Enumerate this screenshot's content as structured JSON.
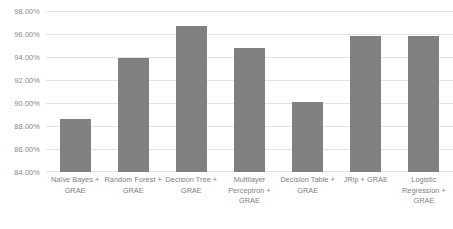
{
  "chart_data": {
    "type": "bar",
    "title": "",
    "xlabel": "",
    "ylabel": "",
    "grid": true,
    "legend": false,
    "ylim": [
      84.0,
      98.0
    ],
    "ytick_values": [
      98.0,
      96.0,
      94.0,
      92.0,
      90.0,
      88.0,
      86.0,
      84.0
    ],
    "ytick_labels": [
      "98.00%",
      "96.00%",
      "94.00%",
      "92.00%",
      "90.00%",
      "88.00%",
      "86.00%",
      "84.00%"
    ],
    "categories": [
      "Naïve Bayes + GRAE",
      "Random Forest + GRAE",
      "Decision Tree + GRAE",
      "Multilayer Perceptron + GRAE",
      "Decision Table + GRAE",
      "JRip + GRAE",
      "Logistic Regression + GRAE"
    ],
    "values": [
      88.6,
      93.9,
      96.7,
      94.8,
      90.1,
      95.8,
      95.8
    ],
    "value_labels": [
      "88.60%",
      "93.90%",
      "96.70%",
      "94.80%",
      "90.10%",
      "95.80%",
      "95.80%"
    ],
    "bar_color": "#808080",
    "gridline_color": "#e4e4e4",
    "tick_label_color": "#8a8a8a",
    "category_label_color": "#808080",
    "background_color": "#ffffff"
  }
}
